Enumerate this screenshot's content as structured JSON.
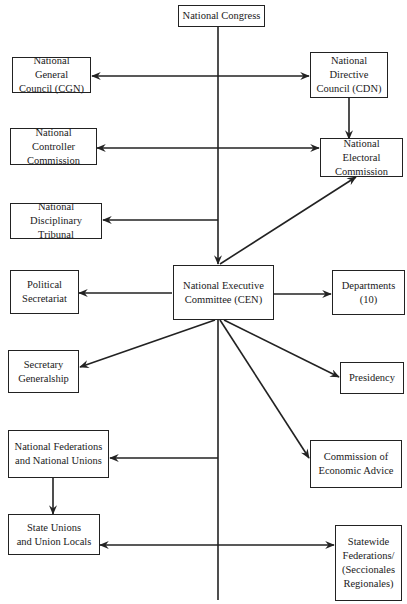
{
  "diagram": {
    "type": "organizational-chart",
    "nodes": {
      "national_congress": "National Congress",
      "cgn": "National General\nCouncil (CGN)",
      "cdn": "National Directive\nCouncil (CDN)",
      "controller": "National Controller\nCommission",
      "electoral": "National Electoral\nCommission",
      "disciplinary": "National Disciplinary\nTribunal",
      "political_secretariat": "Political\nSecretariat",
      "cen": "National Executive\nCommittee (CEN)",
      "departments": "Departments\n(10)",
      "secretary_generalship": "Secretary\nGeneralship",
      "presidency": "Presidency",
      "national_federations": "National Federations\nand National Unions",
      "economic_advice": "Commission of\nEconomic Advice",
      "state_unions": "State Unions\nand Union Locals",
      "statewide_federations": "Statewide\nFederations/\n(Seccionales\nRegionales)"
    },
    "edges": [
      {
        "from": "National Congress",
        "to": "National Executive Committee (CEN)",
        "type": "arrow"
      },
      {
        "from": "central-line",
        "to": "National General Council (CGN)",
        "type": "bidirectional",
        "with": "National Directive Council (CDN)"
      },
      {
        "from": "National Directive Council (CDN)",
        "to": "National Electoral Commission",
        "type": "arrow"
      },
      {
        "from": "National Controller Commission",
        "to": "National Electoral Commission",
        "type": "bidirectional"
      },
      {
        "from": "central-line",
        "to": "National Disciplinary Tribunal",
        "type": "arrow"
      },
      {
        "from": "National Executive Committee (CEN)",
        "to": "National Electoral Commission",
        "type": "arrow"
      },
      {
        "from": "National Executive Committee (CEN)",
        "to": "Political Secretariat",
        "type": "arrow"
      },
      {
        "from": "National Executive Committee (CEN)",
        "to": "Departments (10)",
        "type": "arrow"
      },
      {
        "from": "National Executive Committee (CEN)",
        "to": "Secretary Generalship",
        "type": "arrow"
      },
      {
        "from": "National Executive Committee (CEN)",
        "to": "Presidency",
        "type": "arrow"
      },
      {
        "from": "National Executive Committee (CEN)",
        "to": "Commission of Economic Advice",
        "type": "arrow"
      },
      {
        "from": "central-line",
        "to": "National Federations and National Unions",
        "type": "arrow"
      },
      {
        "from": "National Federations and National Unions",
        "to": "State Unions and Union Locals",
        "type": "arrow"
      },
      {
        "from": "State Unions and Union Locals",
        "to": "Statewide Federations/(Seccionales Regionales)",
        "type": "bidirectional"
      }
    ],
    "colors": {
      "line": "#222222",
      "box_border": "#222222",
      "background": "#ffffff"
    }
  }
}
